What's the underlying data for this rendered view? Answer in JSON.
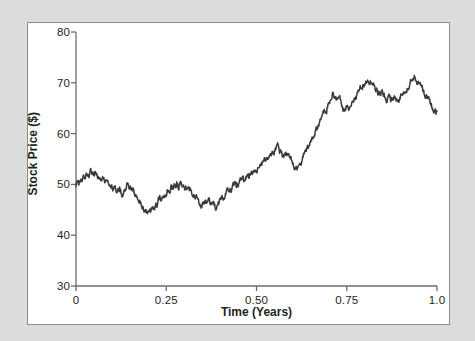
{
  "figure": {
    "background_color": "#dcdcdc",
    "panel_color": "#ffffff",
    "frame_color": "#8c8c8c",
    "line_color": "#3a3a3a"
  },
  "chart_data": {
    "type": "line",
    "title": "",
    "xlabel": "Time (Years)",
    "ylabel": "Stock Price ($)",
    "xlim": [
      0,
      1.0
    ],
    "ylim": [
      30,
      80
    ],
    "grid": false,
    "legend": null,
    "xticks": [
      0,
      0.25,
      0.5,
      0.75,
      1.0
    ],
    "xtick_labels": [
      "0",
      "0.25",
      "0.50",
      "0.75",
      "1.0"
    ],
    "yticks": [
      30,
      40,
      50,
      60,
      70,
      80
    ],
    "ytick_labels": [
      "30",
      "40",
      "50",
      "60",
      "70",
      "80"
    ],
    "series": [
      {
        "name": "Stock Price",
        "color": "#3a3a3a",
        "x": [
          0.0,
          0.004,
          0.008,
          0.012,
          0.016,
          0.02,
          0.024,
          0.028,
          0.032,
          0.036,
          0.04,
          0.044,
          0.048,
          0.052,
          0.056,
          0.06,
          0.064,
          0.068,
          0.072,
          0.076,
          0.08,
          0.084,
          0.088,
          0.092,
          0.096,
          0.1,
          0.104,
          0.108,
          0.112,
          0.116,
          0.12,
          0.124,
          0.128,
          0.132,
          0.136,
          0.14,
          0.144,
          0.148,
          0.152,
          0.156,
          0.16,
          0.164,
          0.168,
          0.172,
          0.176,
          0.18,
          0.184,
          0.188,
          0.192,
          0.196,
          0.2,
          0.204,
          0.208,
          0.212,
          0.216,
          0.22,
          0.224,
          0.228,
          0.232,
          0.236,
          0.24,
          0.244,
          0.248,
          0.252,
          0.256,
          0.26,
          0.264,
          0.268,
          0.272,
          0.276,
          0.28,
          0.284,
          0.288,
          0.292,
          0.296,
          0.3,
          0.304,
          0.308,
          0.312,
          0.316,
          0.32,
          0.324,
          0.328,
          0.332,
          0.336,
          0.34,
          0.344,
          0.348,
          0.352,
          0.356,
          0.36,
          0.364,
          0.368,
          0.372,
          0.376,
          0.38,
          0.384,
          0.388,
          0.392,
          0.396,
          0.4,
          0.404,
          0.408,
          0.412,
          0.416,
          0.42,
          0.424,
          0.428,
          0.432,
          0.436,
          0.44,
          0.444,
          0.448,
          0.452,
          0.456,
          0.46,
          0.464,
          0.468,
          0.472,
          0.476,
          0.48,
          0.484,
          0.488,
          0.492,
          0.496,
          0.5,
          0.504,
          0.508,
          0.512,
          0.516,
          0.52,
          0.524,
          0.528,
          0.532,
          0.536,
          0.54,
          0.544,
          0.548,
          0.552,
          0.556,
          0.56,
          0.564,
          0.568,
          0.572,
          0.576,
          0.58,
          0.584,
          0.588,
          0.592,
          0.596,
          0.6,
          0.604,
          0.608,
          0.612,
          0.616,
          0.62,
          0.624,
          0.628,
          0.632,
          0.636,
          0.64,
          0.644,
          0.648,
          0.652,
          0.656,
          0.66,
          0.664,
          0.668,
          0.672,
          0.676,
          0.68,
          0.684,
          0.688,
          0.692,
          0.696,
          0.7,
          0.704,
          0.708,
          0.712,
          0.716,
          0.72,
          0.724,
          0.728,
          0.732,
          0.736,
          0.74,
          0.744,
          0.748,
          0.752,
          0.756,
          0.76,
          0.764,
          0.768,
          0.772,
          0.776,
          0.78,
          0.784,
          0.788,
          0.792,
          0.796,
          0.8,
          0.804,
          0.808,
          0.812,
          0.816,
          0.82,
          0.824,
          0.828,
          0.832,
          0.836,
          0.84,
          0.844,
          0.848,
          0.852,
          0.856,
          0.86,
          0.864,
          0.868,
          0.872,
          0.876,
          0.88,
          0.884,
          0.888,
          0.892,
          0.896,
          0.9,
          0.904,
          0.908,
          0.912,
          0.916,
          0.92,
          0.924,
          0.928,
          0.932,
          0.936,
          0.94,
          0.944,
          0.948,
          0.952,
          0.956,
          0.96,
          0.964,
          0.968,
          0.972,
          0.976,
          0.98,
          0.984,
          0.988,
          0.992,
          0.996,
          1.0
        ],
        "y": [
          50.0,
          50.6,
          50.3,
          51.0,
          50.6,
          51.3,
          51.0,
          51.6,
          51.2,
          51.8,
          52.3,
          51.9,
          51.6,
          52.1,
          51.7,
          51.3,
          51.6,
          51.2,
          50.9,
          51.2,
          50.8,
          50.4,
          50.7,
          50.3,
          50.0,
          49.6,
          49.3,
          49.5,
          49.1,
          48.8,
          49.2,
          48.8,
          48.4,
          48.7,
          49.2,
          49.8,
          50.1,
          49.7,
          49.3,
          48.8,
          48.3,
          47.8,
          47.3,
          46.9,
          46.4,
          46.0,
          45.6,
          45.2,
          44.8,
          44.5,
          44.2,
          44.4,
          44.9,
          45.4,
          45.2,
          45.7,
          46.2,
          46.7,
          47.2,
          47.0,
          47.5,
          48.0,
          48.5,
          49.0,
          48.7,
          49.2,
          49.7,
          49.4,
          49.9,
          49.5,
          50.0,
          49.6,
          50.1,
          49.7,
          49.3,
          49.8,
          49.4,
          49.0,
          49.4,
          49.0,
          48.6,
          48.2,
          47.8,
          47.4,
          47.0,
          46.7,
          46.3,
          46.0,
          46.4,
          46.1,
          46.5,
          46.2,
          46.6,
          46.3,
          46.0,
          46.4,
          46.1,
          45.8,
          46.2,
          46.6,
          47.0,
          47.4,
          47.1,
          47.5,
          47.9,
          48.3,
          48.0,
          48.4,
          48.8,
          49.2,
          49.6,
          49.3,
          49.7,
          50.1,
          50.5,
          50.9,
          50.6,
          51.0,
          51.4,
          51.8,
          51.5,
          51.9,
          52.3,
          52.7,
          52.4,
          52.8,
          53.2,
          53.6,
          54.0,
          54.4,
          54.1,
          54.5,
          54.9,
          55.3,
          55.7,
          56.1,
          56.5,
          56.9,
          57.3,
          57.7,
          57.3,
          56.8,
          56.3,
          55.8,
          55.3,
          55.7,
          56.1,
          55.6,
          55.1,
          54.6,
          54.1,
          53.6,
          53.1,
          53.5,
          53.9,
          54.4,
          54.9,
          55.4,
          55.9,
          56.4,
          57.0,
          57.6,
          58.2,
          58.8,
          59.4,
          60.0,
          60.6,
          61.2,
          61.8,
          62.4,
          63.0,
          63.6,
          64.2,
          64.8,
          65.4,
          66.0,
          66.6,
          67.2,
          67.8,
          67.3,
          66.8,
          66.3,
          66.8,
          66.3,
          65.8,
          65.3,
          64.8,
          65.2,
          65.6,
          65.1,
          65.5,
          66.0,
          66.5,
          67.0,
          67.5,
          68.0,
          68.5,
          69.0,
          69.5,
          70.0,
          69.5,
          70.0,
          70.5,
          70.0,
          70.5,
          70.0,
          69.5,
          69.0,
          68.5,
          68.0,
          68.4,
          67.9,
          68.3,
          67.8,
          67.3,
          66.8,
          67.2,
          66.7,
          66.2,
          66.6,
          67.0,
          67.4,
          66.9,
          66.4,
          66.8,
          67.2,
          67.6,
          68.0,
          68.4,
          68.8,
          69.2,
          69.6,
          70.0,
          70.4,
          70.8,
          71.2,
          70.7,
          70.2,
          69.7,
          69.2,
          68.7,
          68.2,
          67.7,
          67.2,
          66.7,
          66.2,
          65.7,
          65.2,
          64.7,
          64.2,
          63.8
        ],
        "annotations": [
          {
            "label": "start",
            "x": 0.0,
            "y": 50.0
          },
          {
            "label": "early-low",
            "x": 0.145,
            "y": 44.2
          },
          {
            "label": "mid-low",
            "x": 0.3,
            "y": 46.0
          },
          {
            "label": "local-peak",
            "x": 0.43,
            "y": 57.7
          },
          {
            "label": "global-peak",
            "x": 0.7,
            "y": 71.3
          },
          {
            "label": "end",
            "x": 1.0,
            "y": 41.0
          }
        ]
      }
    ]
  },
  "axes": {
    "x_title": "Time (Years)",
    "y_title": "Stock Price ($)"
  }
}
